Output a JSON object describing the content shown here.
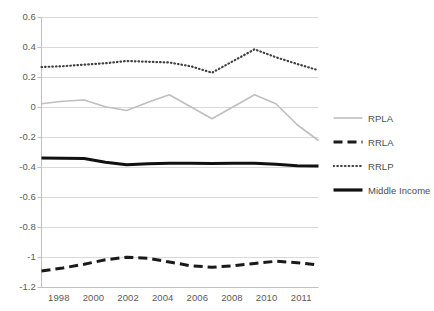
{
  "chart_data": {
    "type": "line",
    "title": "",
    "subtitle": "",
    "xlabel": "",
    "ylabel": "",
    "xlim": [
      1998,
      2011
    ],
    "ylim": [
      -1.2,
      0.6
    ],
    "ytick_labels": [
      "0.6",
      "0.4",
      "0.2",
      "0",
      "-0.2",
      "-0.4",
      "-0.6",
      "-0.8",
      "-1",
      "-1.2"
    ],
    "ytick_values": [
      0.6,
      0.4,
      0.2,
      0,
      -0.2,
      -0.4,
      -0.6,
      -0.8,
      -1,
      -1.2
    ],
    "xtick_labels": [
      "1998",
      "2000",
      "2002",
      "2004",
      "2006",
      "2008",
      "2010",
      "2011"
    ],
    "x": [
      1998,
      1999,
      2000,
      2001,
      2002,
      2003,
      2004,
      2005,
      2006,
      2007,
      2008,
      2009,
      2010,
      2011
    ],
    "grid": "horizontal",
    "legend_position": "right",
    "series": [
      {
        "name": "RPLA",
        "style": "solid-thin",
        "color": "#bfbfbf",
        "values": [
          0.025,
          0.042,
          0.05,
          0.005,
          -0.02,
          0.035,
          0.085,
          0.005,
          -0.075,
          0.005,
          0.085,
          0.025,
          -0.115,
          -0.22
        ]
      },
      {
        "name": "RRLA",
        "style": "dashed-thick",
        "color": "#1a1a1a",
        "values": [
          -1.09,
          -1.07,
          -1.045,
          -1.015,
          -0.998,
          -1.005,
          -1.03,
          -1.055,
          -1.065,
          -1.055,
          -1.04,
          -1.025,
          -1.035,
          -1.05
        ]
      },
      {
        "name": "RRLP",
        "style": "dotted",
        "color": "#3f3f3f",
        "values": [
          0.27,
          0.275,
          0.285,
          0.295,
          0.31,
          0.305,
          0.3,
          0.275,
          0.232,
          0.31,
          0.388,
          0.335,
          0.29,
          0.248
        ]
      },
      {
        "name": "Middle Income",
        "style": "solid-thick",
        "color": "#111111",
        "values": [
          -0.337,
          -0.338,
          -0.34,
          -0.365,
          -0.382,
          -0.375,
          -0.372,
          -0.372,
          -0.373,
          -0.372,
          -0.372,
          -0.378,
          -0.388,
          -0.39
        ]
      }
    ]
  },
  "legend": {
    "items": [
      {
        "label": "RPLA",
        "swatch": "solid-thin-line-icon"
      },
      {
        "label": "RRLA",
        "swatch": "dashed-thick-line-icon"
      },
      {
        "label": "RRLP",
        "swatch": "dotted-line-icon"
      },
      {
        "label": "Middle Income",
        "swatch": "solid-thick-line-icon"
      }
    ]
  },
  "colors": {
    "grid": "#d9d9d9",
    "axis": "#bfbfbf",
    "text": "#595959",
    "background": "#ffffff"
  }
}
